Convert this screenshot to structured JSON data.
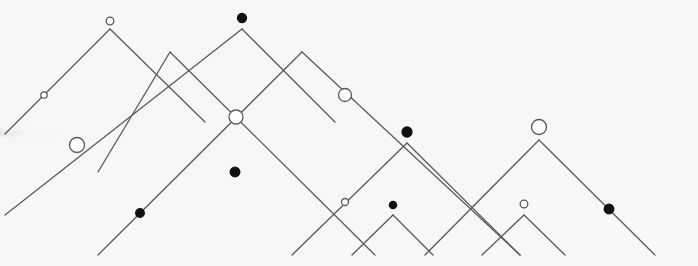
{
  "diagram": {
    "title": "",
    "background": "#f7f7f5",
    "line_color": "#5a5a5a",
    "node_fill_filled": "#111111",
    "node_fill_open": "#ffffff",
    "line_width": 1.3,
    "segments": [
      {
        "id": "s1",
        "x1": 5,
        "y1": 134,
        "x2": 110,
        "y2": 29
      },
      {
        "id": "s2",
        "x1": 110,
        "y1": 29,
        "x2": 205,
        "y2": 122
      },
      {
        "id": "s3",
        "x1": 98,
        "y1": 172,
        "x2": 170,
        "y2": 52
      },
      {
        "id": "s4",
        "x1": 170,
        "y1": 52,
        "x2": 375,
        "y2": 255
      },
      {
        "id": "s5",
        "x1": 5,
        "y1": 215,
        "x2": 242,
        "y2": 29
      },
      {
        "id": "s6",
        "x1": 242,
        "y1": 29,
        "x2": 335,
        "y2": 122
      },
      {
        "id": "s7",
        "x1": 98,
        "y1": 255,
        "x2": 302,
        "y2": 52
      },
      {
        "id": "s8",
        "x1": 302,
        "y1": 52,
        "x2": 520,
        "y2": 255
      },
      {
        "id": "s9",
        "x1": 292,
        "y1": 255,
        "x2": 407,
        "y2": 143
      },
      {
        "id": "s10",
        "x1": 407,
        "y1": 143,
        "x2": 520,
        "y2": 255
      },
      {
        "id": "s11",
        "x1": 352,
        "y1": 255,
        "x2": 393,
        "y2": 215
      },
      {
        "id": "s12",
        "x1": 393,
        "y1": 215,
        "x2": 433,
        "y2": 255
      },
      {
        "id": "s13",
        "x1": 425,
        "y1": 255,
        "x2": 539,
        "y2": 140
      },
      {
        "id": "s14",
        "x1": 539,
        "y1": 140,
        "x2": 655,
        "y2": 255
      },
      {
        "id": "s15",
        "x1": 482,
        "y1": 255,
        "x2": 524,
        "y2": 215
      },
      {
        "id": "s16",
        "x1": 524,
        "y1": 215,
        "x2": 565,
        "y2": 255
      }
    ],
    "nodes": [
      {
        "id": "n1",
        "kind": "open",
        "cx": 110,
        "cy": 21,
        "r": 3.8
      },
      {
        "id": "n2",
        "kind": "open",
        "cx": 44,
        "cy": 95,
        "r": 3.2
      },
      {
        "id": "n3",
        "kind": "open",
        "cx": 77,
        "cy": 145,
        "r": 7.5
      },
      {
        "id": "n4",
        "kind": "filled",
        "cx": 242,
        "cy": 18,
        "r": 4.5
      },
      {
        "id": "n5",
        "kind": "open",
        "cx": 236,
        "cy": 117,
        "r": 7
      },
      {
        "id": "n6",
        "kind": "filled",
        "cx": 235,
        "cy": 172,
        "r": 4.8
      },
      {
        "id": "n7",
        "kind": "filled",
        "cx": 140,
        "cy": 213,
        "r": 4.3
      },
      {
        "id": "n8",
        "kind": "open",
        "cx": 345,
        "cy": 95,
        "r": 6.5
      },
      {
        "id": "n9",
        "kind": "filled",
        "cx": 407,
        "cy": 132,
        "r": 5
      },
      {
        "id": "n10",
        "kind": "open",
        "cx": 345,
        "cy": 202,
        "r": 3.5
      },
      {
        "id": "n11",
        "kind": "filled",
        "cx": 393,
        "cy": 205,
        "r": 3.6
      },
      {
        "id": "n12",
        "kind": "open",
        "cx": 539,
        "cy": 127,
        "r": 7.5
      },
      {
        "id": "n13",
        "kind": "open",
        "cx": 524,
        "cy": 204,
        "r": 3.8
      },
      {
        "id": "n14",
        "kind": "filled",
        "cx": 609,
        "cy": 209,
        "r": 4.8
      }
    ]
  }
}
